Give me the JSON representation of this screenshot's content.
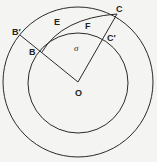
{
  "diagram": {
    "type": "geometry",
    "points": {
      "O": {
        "label": "O",
        "x": 78,
        "y": 82
      },
      "B": {
        "label": "B",
        "x": 42,
        "y": 52
      },
      "B_prime": {
        "label": "B′",
        "x": 20,
        "y": 35
      },
      "C": {
        "label": "C",
        "x": 117,
        "y": 14
      },
      "C_prime": {
        "label": "C′",
        "x": 107,
        "y": 38
      }
    },
    "arc_labels": {
      "E": "E",
      "F": "F"
    },
    "region_label": "σ",
    "circles": {
      "outer": {
        "cx": 78,
        "cy": 82,
        "r": 75
      },
      "inner": {
        "cx": 78,
        "cy": 83,
        "r": 50
      }
    },
    "colors": {
      "stroke": "#2a2a2a",
      "background": "#f4f4f2"
    }
  }
}
